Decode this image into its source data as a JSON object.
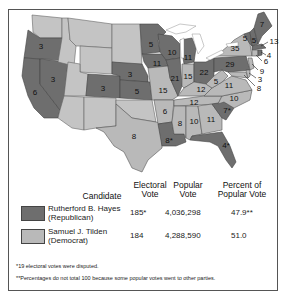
{
  "map": {
    "title": "Election of 1876",
    "legend_colors": {
      "republican": "#6e6e6e",
      "democrat": "#b9b9b9"
    },
    "states": [
      {
        "name": "Oregon",
        "votes": "3",
        "party": "republican"
      },
      {
        "name": "California",
        "votes": "6",
        "party": "republican"
      },
      {
        "name": "Nevada",
        "votes": "3",
        "party": "republican"
      },
      {
        "name": "Colorado",
        "votes": "3",
        "party": "republican"
      },
      {
        "name": "Nebraska",
        "votes": "3",
        "party": "republican"
      },
      {
        "name": "Kansas",
        "votes": "5",
        "party": "republican"
      },
      {
        "name": "Texas",
        "votes": "8",
        "party": "democrat"
      },
      {
        "name": "Minnesota",
        "votes": "5",
        "party": "republican"
      },
      {
        "name": "Iowa",
        "votes": "11",
        "party": "republican"
      },
      {
        "name": "Missouri",
        "votes": "15",
        "party": "democrat"
      },
      {
        "name": "Arkansas",
        "votes": "6",
        "party": "democrat"
      },
      {
        "name": "Louisiana",
        "votes": "8*",
        "party": "republican"
      },
      {
        "name": "Wisconsin",
        "votes": "10",
        "party": "republican"
      },
      {
        "name": "Illinois",
        "votes": "21",
        "party": "republican"
      },
      {
        "name": "Michigan",
        "votes": "11",
        "party": "republican"
      },
      {
        "name": "Indiana",
        "votes": "15",
        "party": "democrat"
      },
      {
        "name": "Ohio",
        "votes": "22",
        "party": "republican"
      },
      {
        "name": "Kentucky",
        "votes": "12",
        "party": "democrat"
      },
      {
        "name": "Tennessee",
        "votes": "12",
        "party": "democrat"
      },
      {
        "name": "Mississippi",
        "votes": "8",
        "party": "democrat"
      },
      {
        "name": "Alabama",
        "votes": "10",
        "party": "democrat"
      },
      {
        "name": "Georgia",
        "votes": "11",
        "party": "democrat"
      },
      {
        "name": "Florida",
        "votes": "4*",
        "party": "republican"
      },
      {
        "name": "South Carolina",
        "votes": "7*",
        "party": "republican"
      },
      {
        "name": "North Carolina",
        "votes": "10",
        "party": "democrat"
      },
      {
        "name": "Virginia",
        "votes": "11",
        "party": "democrat"
      },
      {
        "name": "West Virginia",
        "votes": "5",
        "party": "democrat"
      },
      {
        "name": "Pennsylvania",
        "votes": "29",
        "party": "republican"
      },
      {
        "name": "New York",
        "votes": "35",
        "party": "democrat"
      },
      {
        "name": "Vermont",
        "votes": "5",
        "party": "republican"
      },
      {
        "name": "New Hampshire",
        "votes": "5",
        "party": "republican"
      },
      {
        "name": "Maine",
        "votes": "7",
        "party": "republican"
      },
      {
        "name": "Massachusetts",
        "votes": "13",
        "party": "republican"
      },
      {
        "name": "Rhode Island",
        "votes": "4",
        "party": "republican"
      },
      {
        "name": "Connecticut",
        "votes": "6",
        "party": "democrat"
      },
      {
        "name": "New Jersey",
        "votes": "9",
        "party": "democrat"
      },
      {
        "name": "Delaware",
        "votes": "3",
        "party": "democrat"
      },
      {
        "name": "Maryland",
        "votes": "8",
        "party": "democrat"
      }
    ]
  },
  "table": {
    "headers": {
      "candidate": "Candidate",
      "electoral_1": "Electoral",
      "electoral_2": "Vote",
      "popular_1": "Popular",
      "popular_2": "Vote",
      "percent_1": "Percent of",
      "percent_2": "Popular Vote"
    },
    "rows": [
      {
        "name": "Rutherford B. Hayes",
        "party": "(Republican)",
        "electoral": "185*",
        "popular": "4,036,298",
        "percent": "47.9**",
        "color": "#6e6e6e"
      },
      {
        "name": "Samuel J. Tilden",
        "party": "(Democrat)",
        "electoral": "184",
        "popular": "4,288,590",
        "percent": "51.0",
        "color": "#b9b9b9"
      }
    ]
  },
  "footnotes": {
    "note1": "*19 electoral votes were disputed.",
    "note2": "**Percentages do not total 100 because some popular votes went to other parties."
  }
}
